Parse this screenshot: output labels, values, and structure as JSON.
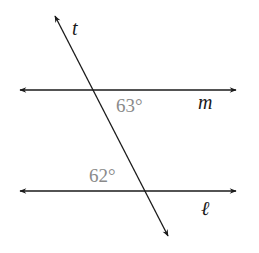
{
  "diagram": {
    "type": "parallel-lines-transversal",
    "lines": {
      "transversal": {
        "label": "t"
      },
      "upper": {
        "label": "m"
      },
      "lower": {
        "label": "ℓ"
      }
    },
    "angles": [
      {
        "label": "63°",
        "location": "below line m, right of transversal"
      },
      {
        "label": "62°",
        "location": "above line ℓ, left of transversal"
      }
    ],
    "colors": {
      "line": "#1a1a1a",
      "angle_text": "#8a8a8a",
      "background": "#ffffff"
    }
  }
}
